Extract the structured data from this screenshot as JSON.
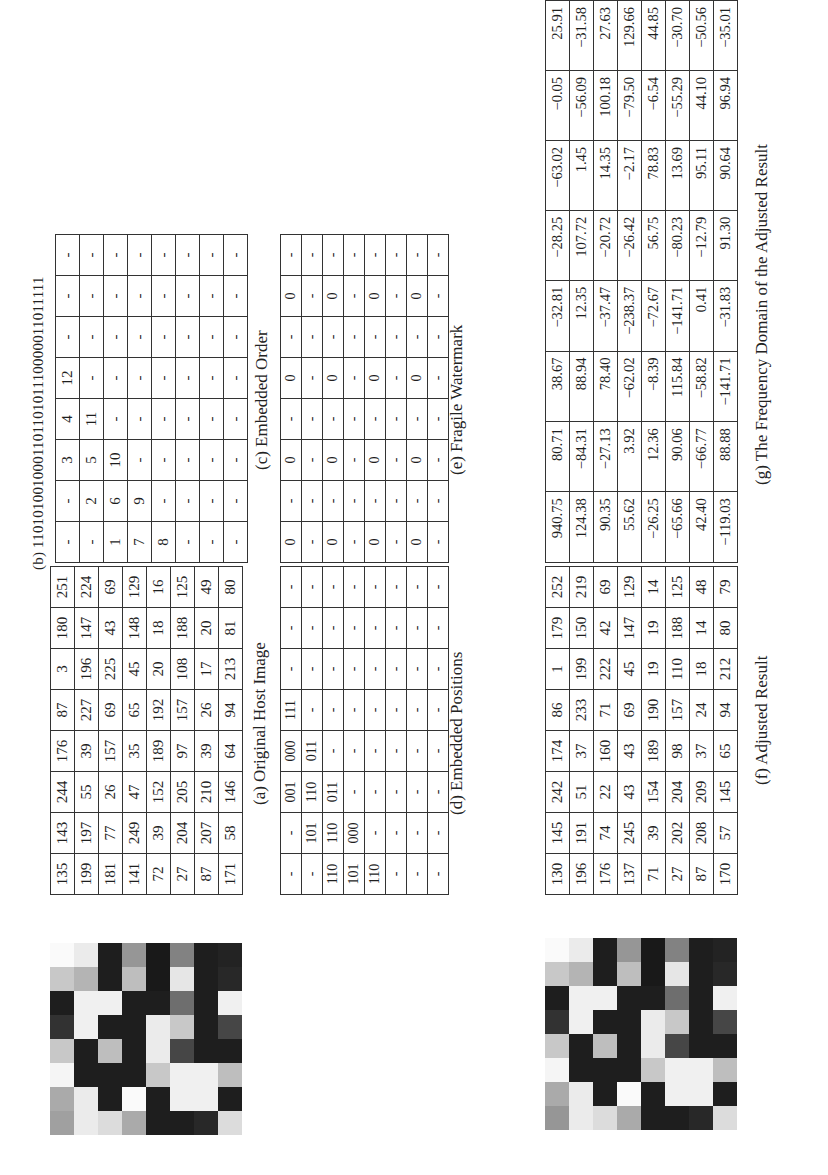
{
  "figure": {
    "a": {
      "caption": "(a) Original Host Image",
      "rows": [
        [
          "135",
          "143",
          "244",
          "176",
          "87",
          "3",
          "180",
          "251"
        ],
        [
          "199",
          "197",
          "55",
          "39",
          "227",
          "196",
          "147",
          "224"
        ],
        [
          "181",
          "77",
          "26",
          "157",
          "69",
          "225",
          "43",
          "69"
        ],
        [
          "141",
          "249",
          "47",
          "35",
          "65",
          "45",
          "148",
          "129"
        ],
        [
          "72",
          "39",
          "152",
          "189",
          "192",
          "20",
          "18",
          "16"
        ],
        [
          "27",
          "204",
          "205",
          "97",
          "157",
          "108",
          "188",
          "125"
        ],
        [
          "87",
          "207",
          "210",
          "39",
          "26",
          "17",
          "20",
          "49"
        ],
        [
          "171",
          "58",
          "146",
          "64",
          "94",
          "213",
          "81",
          "80"
        ]
      ],
      "pixel_grays": [
        [
          250,
          235,
          30,
          150,
          25,
          130,
          30,
          35
        ],
        [
          200,
          180,
          30,
          190,
          25,
          230,
          30,
          40
        ],
        [
          30,
          240,
          240,
          30,
          30,
          110,
          30,
          240
        ],
        [
          50,
          240,
          30,
          30,
          235,
          200,
          30,
          70
        ],
        [
          200,
          30,
          190,
          30,
          235,
          70,
          30,
          30
        ],
        [
          245,
          30,
          30,
          30,
          200,
          240,
          240,
          190
        ],
        [
          170,
          235,
          30,
          250,
          30,
          240,
          240,
          30
        ],
        [
          160,
          235,
          220,
          170,
          30,
          30,
          40,
          220
        ]
      ]
    },
    "b": {
      "label": "(b) 110101001000110110101110000011011111",
      "rows": [
        [
          "-",
          "-",
          "3",
          "4",
          "12",
          "-",
          "-",
          "-"
        ],
        [
          "-",
          "2",
          "5",
          "11",
          "-",
          "-",
          "-",
          "-"
        ],
        [
          "1",
          "6",
          "10",
          "-",
          "-",
          "-",
          "-",
          "-"
        ],
        [
          "7",
          "9",
          "-",
          "-",
          "-",
          "-",
          "-",
          "-"
        ],
        [
          "8",
          "-",
          "-",
          "-",
          "-",
          "-",
          "-",
          "-"
        ],
        [
          "-",
          "-",
          "-",
          "-",
          "-",
          "-",
          "-",
          "-"
        ],
        [
          "-",
          "-",
          "-",
          "-",
          "-",
          "-",
          "-",
          "-"
        ],
        [
          "-",
          "-",
          "-",
          "-",
          "-",
          "-",
          "-",
          "-"
        ]
      ]
    },
    "c": {
      "caption": "(c) Embedded Order"
    },
    "d": {
      "caption": "(d) Embedded Positions",
      "rows": [
        [
          "-",
          "-",
          "001",
          "000",
          "111",
          "-",
          "-",
          "-"
        ],
        [
          "-",
          "101",
          "110",
          "011",
          "-",
          "-",
          "-",
          "-"
        ],
        [
          "110",
          "110",
          "011",
          "-",
          "-",
          "-",
          "-",
          "-"
        ],
        [
          "101",
          "000",
          "-",
          "-",
          "-",
          "-",
          "-",
          "-"
        ],
        [
          "110",
          "-",
          "-",
          "-",
          "-",
          "-",
          "-",
          "-"
        ],
        [
          "-",
          "-",
          "-",
          "-",
          "-",
          "-",
          "-",
          "-"
        ],
        [
          "-",
          "-",
          "-",
          "-",
          "-",
          "-",
          "-",
          "-"
        ],
        [
          "-",
          "-",
          "-",
          "-",
          "-",
          "-",
          "-",
          "-"
        ]
      ]
    },
    "e": {
      "caption": "(e) Fragile Watermark",
      "rows": [
        [
          "0",
          "-",
          "0",
          "-",
          "0",
          "-",
          "0",
          "-"
        ],
        [
          "-",
          "-",
          "-",
          "-",
          "-",
          "-",
          "-",
          "-"
        ],
        [
          "0",
          "-",
          "0",
          "-",
          "0",
          "-",
          "0",
          "-"
        ],
        [
          "-",
          "-",
          "-",
          "-",
          "-",
          "-",
          "-",
          "-"
        ],
        [
          "0",
          "-",
          "0",
          "-",
          "0",
          "-",
          "0",
          "-"
        ],
        [
          "-",
          "-",
          "-",
          "-",
          "-",
          "-",
          "-",
          "-"
        ],
        [
          "0",
          "-",
          "0",
          "-",
          "0",
          "-",
          "0",
          "-"
        ],
        [
          "-",
          "-",
          "-",
          "-",
          "-",
          "-",
          "-",
          "-"
        ]
      ]
    },
    "f": {
      "caption": "(f) Adjusted Result",
      "rows": [
        [
          "130",
          "145",
          "242",
          "174",
          "86",
          "1",
          "179",
          "252"
        ],
        [
          "196",
          "191",
          "51",
          "37",
          "233",
          "199",
          "150",
          "219"
        ],
        [
          "176",
          "74",
          "22",
          "160",
          "71",
          "222",
          "42",
          "69"
        ],
        [
          "137",
          "245",
          "43",
          "43",
          "69",
          "45",
          "147",
          "129"
        ],
        [
          "71",
          "39",
          "154",
          "189",
          "190",
          "19",
          "19",
          "14"
        ],
        [
          "27",
          "202",
          "204",
          "98",
          "157",
          "110",
          "188",
          "125"
        ],
        [
          "87",
          "208",
          "209",
          "37",
          "24",
          "18",
          "14",
          "48"
        ],
        [
          "170",
          "57",
          "145",
          "65",
          "94",
          "212",
          "80",
          "79"
        ]
      ],
      "pixel_grays": [
        [
          250,
          235,
          30,
          150,
          25,
          130,
          30,
          35
        ],
        [
          200,
          180,
          30,
          190,
          25,
          230,
          30,
          40
        ],
        [
          30,
          240,
          240,
          30,
          30,
          110,
          30,
          240
        ],
        [
          50,
          240,
          30,
          30,
          235,
          200,
          30,
          70
        ],
        [
          200,
          30,
          190,
          30,
          235,
          70,
          30,
          30
        ],
        [
          245,
          30,
          30,
          30,
          200,
          240,
          240,
          190
        ],
        [
          170,
          235,
          30,
          250,
          30,
          240,
          240,
          30
        ],
        [
          150,
          235,
          220,
          170,
          30,
          30,
          40,
          220
        ]
      ]
    },
    "g": {
      "caption": "(g) The Frequency Domain of the Adjusted Result",
      "rows": [
        [
          "940.75",
          "80.71",
          "38.67",
          "−32.81",
          "−28.25",
          "−63.02",
          "−0.05",
          "25.91"
        ],
        [
          "124.38",
          "−84.31",
          "88.94",
          "12.35",
          "107.72",
          "1.45",
          "−56.09",
          "−31.58"
        ],
        [
          "90.35",
          "−27.13",
          "78.40",
          "−37.47",
          "−20.72",
          "14.35",
          "100.18",
          "27.63"
        ],
        [
          "55.62",
          "3.92",
          "−62.02",
          "−238.37",
          "−26.42",
          "−2.17",
          "−79.50",
          "129.66"
        ],
        [
          "−26.25",
          "12.36",
          "−8.39",
          "−72.67",
          "56.75",
          "78.83",
          "−6.54",
          "44.85"
        ],
        [
          "−65.66",
          "90.06",
          "115.84",
          "−141.71",
          "−80.23",
          "13.69",
          "−55.29",
          "−30.70"
        ],
        [
          "42.40",
          "−66.77",
          "−58.82",
          "0.41",
          "−12.79",
          "95.11",
          "44.10",
          "−50.56"
        ],
        [
          "−119.03",
          "88.88",
          "−141.71",
          "−31.83",
          "91.30",
          "90.64",
          "96.94",
          "−35.01"
        ]
      ]
    }
  }
}
